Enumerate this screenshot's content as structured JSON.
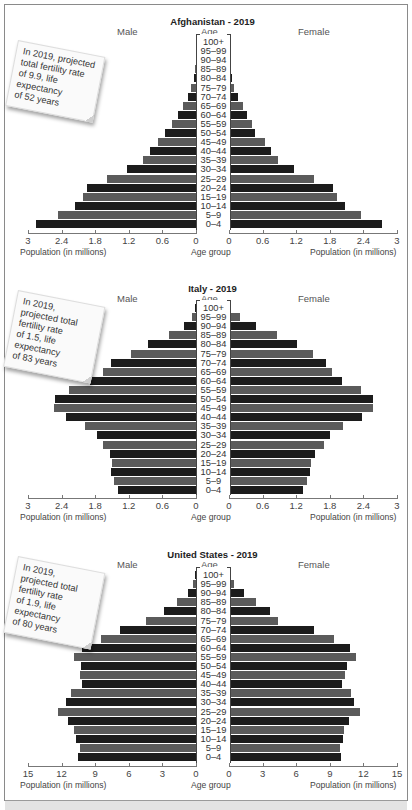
{
  "figure": {
    "bottom_band": ""
  },
  "chart_data": [
    {
      "type": "bar",
      "subtype": "population-pyramid",
      "title": "Afghanistan - 2019",
      "left_label": "Male",
      "right_label": "Female",
      "center_label": "Age",
      "xlabel_left": "Population (in millions)",
      "xlabel_center": "Age group",
      "xlabel_right": "Population (in millions)",
      "ticks_left": [
        "3",
        "2.4",
        "1.8",
        "1.2",
        "0.6",
        "0"
      ],
      "ticks_right": [
        "0",
        "0.6",
        "1.2",
        "1.8",
        "2.4",
        "3"
      ],
      "xlim": [
        0,
        3
      ],
      "note": [
        "In 2019, projected",
        "total fertility rate",
        "of 9.9, life",
        "expectancy",
        "of 52 years"
      ],
      "categories": [
        "100+",
        "95–99",
        "90–94",
        "85–89",
        "80–84",
        "75–79",
        "70–74",
        "65–69",
        "60–64",
        "55–59",
        "50–54",
        "45–49",
        "40–44",
        "35–39",
        "30–34",
        "25–29",
        "20–24",
        "15–19",
        "10–14",
        "5–9",
        "0–4"
      ],
      "series": [
        {
          "name": "Male",
          "values": [
            0.0,
            0.0,
            0.0,
            0.01,
            0.04,
            0.09,
            0.14,
            0.23,
            0.32,
            0.43,
            0.55,
            0.68,
            0.82,
            0.95,
            1.23,
            1.59,
            1.95,
            2.02,
            2.16,
            2.46,
            2.86
          ]
        },
        {
          "name": "Female",
          "values": [
            0.0,
            0.0,
            0.0,
            0.01,
            0.05,
            0.09,
            0.16,
            0.25,
            0.32,
            0.41,
            0.46,
            0.64,
            0.75,
            0.88,
            1.16,
            1.51,
            1.86,
            1.93,
            2.08,
            2.36,
            2.74
          ]
        }
      ]
    },
    {
      "type": "bar",
      "subtype": "population-pyramid",
      "title": "Italy - 2019",
      "left_label": "Male",
      "right_label": "Female",
      "center_label": "Age",
      "xlabel_left": "Population (in millions)",
      "xlabel_center": "Age group",
      "xlabel_right": "Population (in millions)",
      "ticks_left": [
        "3",
        "2.4",
        "1.8",
        "1.2",
        "0.6",
        "0"
      ],
      "ticks_right": [
        "0",
        "0.6",
        "1.2",
        "1.8",
        "2.4",
        "3"
      ],
      "xlim": [
        0,
        3
      ],
      "note": [
        "In 2019,",
        "projected total",
        "fertility rate",
        "of 1.5, life",
        "expectancy",
        "of 83 years"
      ],
      "categories": [
        "100+",
        "95–99",
        "90–94",
        "85–89",
        "80–84",
        "75–79",
        "70–74",
        "65–69",
        "60–64",
        "55–59",
        "50–54",
        "45–49",
        "40–44",
        "35–39",
        "30–34",
        "25–29",
        "20–24",
        "15–19",
        "10–14",
        "5–9",
        "0–4"
      ],
      "series": [
        {
          "name": "Male",
          "values": [
            0.02,
            0.07,
            0.21,
            0.48,
            0.86,
            1.16,
            1.52,
            1.66,
            1.89,
            2.27,
            2.52,
            2.54,
            2.32,
            1.98,
            1.77,
            1.66,
            1.54,
            1.5,
            1.52,
            1.46,
            1.39
          ]
        },
        {
          "name": "Female",
          "values": [
            0.04,
            0.2,
            0.48,
            0.86,
            1.21,
            1.5,
            1.73,
            1.84,
            2.02,
            2.36,
            2.57,
            2.57,
            2.38,
            2.04,
            1.8,
            1.7,
            1.54,
            1.46,
            1.45,
            1.39,
            1.32
          ]
        }
      ]
    },
    {
      "type": "bar",
      "subtype": "population-pyramid",
      "title": "United States - 2019",
      "left_label": "Male",
      "right_label": "Female",
      "center_label": "Age",
      "xlabel_left": "Population (in millions)",
      "xlabel_center": "Age group",
      "xlabel_right": "Population (in millions)",
      "ticks_left": [
        "15",
        "12",
        "9",
        "6",
        "3",
        "0"
      ],
      "ticks_right": [
        "0",
        "3",
        "6",
        "9",
        "12",
        "15"
      ],
      "xlim": [
        0,
        15
      ],
      "note": [
        "In 2019,",
        "projected total",
        "fertility rate",
        "of 1.9, life",
        "expectancy",
        "of 80 years"
      ],
      "categories": [
        "100+",
        "95–99",
        "90–94",
        "85–89",
        "80–84",
        "75–79",
        "70–74",
        "65–69",
        "60–64",
        "55–59",
        "50–54",
        "45–49",
        "40–44",
        "35–39",
        "30–34",
        "25–29",
        "20–24",
        "15–19",
        "10–14",
        "5–9",
        "0–4"
      ],
      "series": [
        {
          "name": "Male",
          "values": [
            0.05,
            0.27,
            0.71,
            1.7,
            2.86,
            4.46,
            6.8,
            8.5,
            10.2,
            10.9,
            10.3,
            10.4,
            10.2,
            11.2,
            11.6,
            12.3,
            11.4,
            10.9,
            10.7,
            10.4,
            10.5
          ]
        },
        {
          "name": "Female",
          "values": [
            0.1,
            0.45,
            1.3,
            2.4,
            3.7,
            4.4,
            7.6,
            9.4,
            10.8,
            11.3,
            10.5,
            10.4,
            10.1,
            10.9,
            11.2,
            11.7,
            10.7,
            10.3,
            10.2,
            9.9,
            10.0
          ]
        }
      ]
    }
  ],
  "colors": {
    "bar_dark": "#1c1c1c",
    "bar_mid": "#5b5b5b",
    "axis": "#777777",
    "frame": "#8a8a8a",
    "bottom_band": "#e3e3e3"
  }
}
